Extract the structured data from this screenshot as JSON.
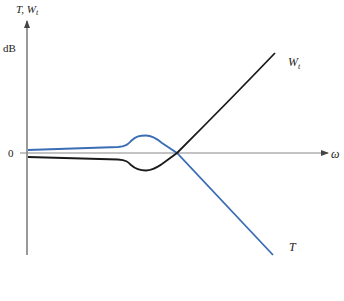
{
  "diagram": {
    "y_axis_label": "T, W",
    "y_axis_label_sub": "t",
    "y_unit": "dB",
    "zero_label": "0",
    "x_axis_label": "ω",
    "curves": [
      {
        "name": "W",
        "sub": "t",
        "color": "#1a1a1a"
      },
      {
        "name": "T",
        "sub": "",
        "color": "#3a6db5"
      }
    ]
  }
}
